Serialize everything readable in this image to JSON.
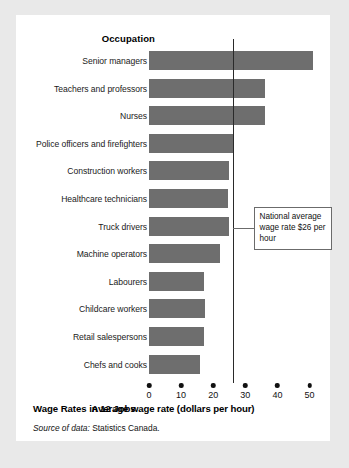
{
  "figure": {
    "axis_header": "Occupation",
    "caption_title": "Wage Rates in 12 Jobs",
    "source_lead": "Source of data:",
    "source_text": " Statistics Canada.",
    "annotation": "National average wage rate $26 per hour",
    "colors": {
      "bar": "#6e6e6e",
      "page_background": "#e9e9e9",
      "card_background": "#ffffff",
      "reference_line": "#2a2a2a",
      "text": "#111111"
    }
  },
  "chart_data": {
    "type": "bar",
    "orientation": "horizontal",
    "title": "Wage Rates in 12 Jobs",
    "xlabel": "Average wage rate (dollars per hour)",
    "ylabel": "Occupation",
    "xlim": [
      0,
      52
    ],
    "xticks": [
      0,
      10,
      20,
      30,
      40,
      50
    ],
    "xtick_labels": [
      "0",
      "10",
      "20",
      "30",
      "40",
      "50"
    ],
    "grid": false,
    "legend": null,
    "categories": [
      "Senior managers",
      "Teachers and professors",
      "Nurses",
      "Police officers and firefighters",
      "Construction workers",
      "Healthcare technicians",
      "Truck drivers",
      "Machine operators",
      "Labourers",
      "Childcare workers",
      "Retail salespersons",
      "Chefs and cooks"
    ],
    "values": [
      51,
      36,
      36,
      26,
      25,
      24.5,
      25,
      22,
      17,
      17.3,
      17,
      16
    ],
    "annotations": [
      {
        "type": "vline",
        "value": 26,
        "label": "National average wage rate $26 per hour"
      }
    ]
  }
}
